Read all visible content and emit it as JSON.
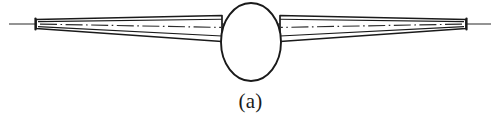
{
  "figure": {
    "caption": "(a)",
    "title": "",
    "kind": "technical-line-drawing",
    "colors": {
      "stroke": "#1a1a1a",
      "fill": "#ffffff",
      "background": "#ffffff",
      "centerline": "#2b2b2b"
    },
    "geometry": {
      "canvas_width": 501,
      "canvas_height": 121,
      "axis_y": 24,
      "axis_x_start": 9,
      "axis_x_end": 491,
      "hub": {
        "center_x": 251,
        "center_y": 42,
        "radius_x": 30,
        "radius_y": 39
      },
      "left_tip_x": 33,
      "right_tip_x": 469,
      "arm_root_left_x": 221,
      "arm_root_right_x": 281,
      "tip_half_height": 5,
      "root_half_height": 13
    },
    "elements": [
      {
        "name": "center-axis-line",
        "style": "thin-solid"
      },
      {
        "name": "left-arm-outline",
        "style": "tapered-wedge"
      },
      {
        "name": "right-arm-outline",
        "style": "tapered-wedge"
      },
      {
        "name": "left-arm-centerline",
        "style": "dash-dot"
      },
      {
        "name": "right-arm-centerline",
        "style": "dash-dot"
      },
      {
        "name": "left-tip-endcap",
        "style": "vertical-bar"
      },
      {
        "name": "right-tip-endcap",
        "style": "vertical-bar"
      },
      {
        "name": "central-hub-ellipse",
        "style": "solid-outline"
      }
    ]
  }
}
